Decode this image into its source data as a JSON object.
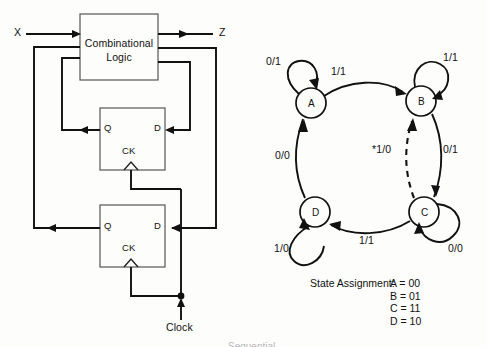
{
  "figure": {
    "domain": "diagram",
    "page_background": "#fdfdfb",
    "ink_color": "#111111"
  },
  "circuit": {
    "title": "Sequential circuit block diagram",
    "block": {
      "name": "combinational-logic-block",
      "line1": "Combinational",
      "line2": "Logic"
    },
    "signals": {
      "input_label": "X",
      "output_label": "Z",
      "clock_label": "Clock"
    },
    "flipflops": [
      {
        "name": "flip-flop-1",
        "q_label": "Q",
        "d_label": "D",
        "ck_label": "CK"
      },
      {
        "name": "flip-flop-2",
        "q_label": "Q",
        "d_label": "D",
        "ck_label": "CK"
      }
    ]
  },
  "state_diagram": {
    "title": "State transition diagram",
    "states": [
      {
        "id": "A",
        "label": "A",
        "cx": 311,
        "cy": 103,
        "r": 15
      },
      {
        "id": "B",
        "label": "B",
        "cx": 421,
        "cy": 101,
        "r": 15
      },
      {
        "id": "C",
        "label": "C",
        "cx": 424,
        "cy": 212,
        "r": 15
      },
      {
        "id": "D",
        "label": "D",
        "cx": 315,
        "cy": 212,
        "r": 15
      }
    ],
    "transitions": [
      {
        "from": "A",
        "to": "A",
        "label": "0/1",
        "kind": "self-loop",
        "label_x": 266,
        "label_y": 56
      },
      {
        "from": "A",
        "to": "B",
        "label": "1/1",
        "kind": "arc",
        "label_x": 331,
        "label_y": 66
      },
      {
        "from": "B",
        "to": "B",
        "label": "1/1",
        "kind": "self-loop",
        "label_x": 443,
        "label_y": 52
      },
      {
        "from": "B",
        "to": "C",
        "label": "0/1",
        "kind": "arc",
        "label_x": 443,
        "label_y": 144
      },
      {
        "from": "C",
        "to": "B",
        "label": "*1/0",
        "kind": "dashed",
        "label_x": 374,
        "label_y": 144
      },
      {
        "from": "C",
        "to": "C",
        "label": "0/0",
        "kind": "self-loop",
        "label_x": 448,
        "label_y": 243
      },
      {
        "from": "C",
        "to": "D",
        "label": "1/1",
        "kind": "arc",
        "label_x": 359,
        "label_y": 235
      },
      {
        "from": "D",
        "to": "D",
        "label": "1/0",
        "kind": "self-loop",
        "label_x": 276,
        "label_y": 243
      },
      {
        "from": "D",
        "to": "A",
        "label": "0/0",
        "kind": "arc",
        "label_x": 277,
        "label_y": 150
      }
    ]
  },
  "state_assignment": {
    "heading": "State Assignment:",
    "rows": [
      {
        "state": "A",
        "code": "A = 00"
      },
      {
        "state": "B",
        "code": "B = 01"
      },
      {
        "state": "C",
        "code": "C = 11"
      },
      {
        "state": "D",
        "code": "D = 10"
      }
    ],
    "codes_text": "A = 00\nB = 01\nC = 11\nD = 10"
  },
  "footer": {
    "cut_caption": "Sequential"
  }
}
